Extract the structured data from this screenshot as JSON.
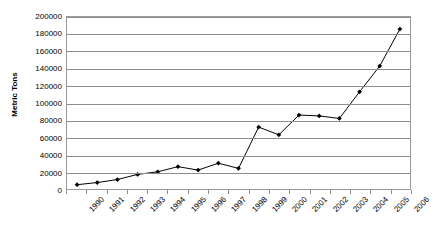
{
  "chart_data": {
    "type": "line",
    "title": "",
    "xlabel": "",
    "ylabel": "Metric Tons",
    "ylim": [
      0,
      200000
    ],
    "ytick_step": 20000,
    "yticks": [
      "0",
      "20000",
      "40000",
      "60000",
      "80000",
      "100000",
      "120000",
      "140000",
      "160000",
      "180000",
      "200000"
    ],
    "grid": true,
    "legend": "none",
    "marker": "filled-diamond",
    "line_color": "#000000",
    "marker_color": "#000000",
    "grid_color": "#8d8d8d",
    "border_color": "#9a9a9a",
    "categories": [
      "1990",
      "1991",
      "1992",
      "1993",
      "1994",
      "1995",
      "1996",
      "1997",
      "1998",
      "1999",
      "2000",
      "2001",
      "2002",
      "2003",
      "2004",
      "2005",
      "2006"
    ],
    "values": [
      5000,
      7500,
      11000,
      17000,
      20000,
      26000,
      22000,
      30000,
      24000,
      72000,
      63000,
      86000,
      85000,
      82000,
      113000,
      143000,
      186000
    ],
    "series": [
      {
        "name": "Metric Tons",
        "values": [
          5000,
          7500,
          11000,
          17000,
          20000,
          26000,
          22000,
          30000,
          24000,
          72000,
          63000,
          86000,
          85000,
          82000,
          113000,
          143000,
          186000
        ]
      }
    ]
  }
}
